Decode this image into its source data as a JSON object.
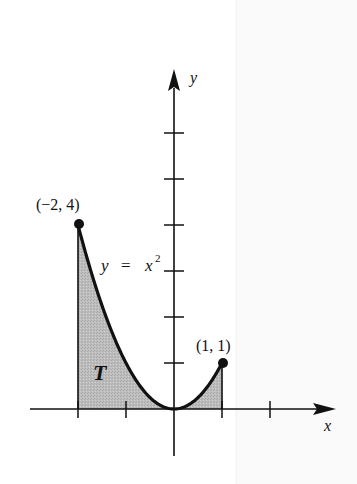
{
  "figure": {
    "title": "",
    "colors": {
      "background": "#ffffff",
      "ink": "#111111",
      "shade": "#b9b9b9",
      "page_edge": "#f4f4f4"
    },
    "axes": {
      "x_label": "x",
      "y_label": "y",
      "x_ticks": [
        -2,
        -1,
        1,
        2
      ],
      "y_ticks": [
        1,
        2,
        3,
        4,
        5,
        6
      ],
      "origin_px": [
        174,
        409
      ],
      "unit_px": [
        48,
        46
      ]
    },
    "curve": {
      "equation_label_lhs": "y",
      "equation_label_eq": "=",
      "equation_label_rhs": "x",
      "equation_label_exp": "2",
      "x_from": -2,
      "x_to": 1
    },
    "points": [
      {
        "label": "(−2, 4)",
        "x": -2,
        "y": 4
      },
      {
        "label": "(1, 1)",
        "x": 1,
        "y": 1
      }
    ],
    "region": {
      "label": "T"
    }
  },
  "chart_data": {
    "type": "area",
    "title": "",
    "xlabel": "x",
    "ylabel": "y",
    "function": "y = x^2",
    "shaded_region": {
      "name": "T",
      "x_range": [
        -2,
        1
      ]
    },
    "x": [
      -2,
      -1.5,
      -1,
      -0.5,
      0,
      0.5,
      1
    ],
    "series": [
      {
        "name": "y = x^2",
        "values": [
          4,
          2.25,
          1,
          0.25,
          0,
          0.25,
          1
        ]
      }
    ],
    "points": [
      {
        "label": "(-2, 4)",
        "x": -2,
        "y": 4
      },
      {
        "label": "(1, 1)",
        "x": 1,
        "y": 1
      }
    ],
    "x_ticks": [
      -2,
      -1,
      0,
      1,
      2
    ],
    "y_ticks": [
      0,
      1,
      2,
      3,
      4,
      5,
      6
    ],
    "xlim": [
      -3,
      3.3
    ],
    "ylim": [
      -1,
      7.3
    ],
    "grid": false,
    "legend": null
  }
}
